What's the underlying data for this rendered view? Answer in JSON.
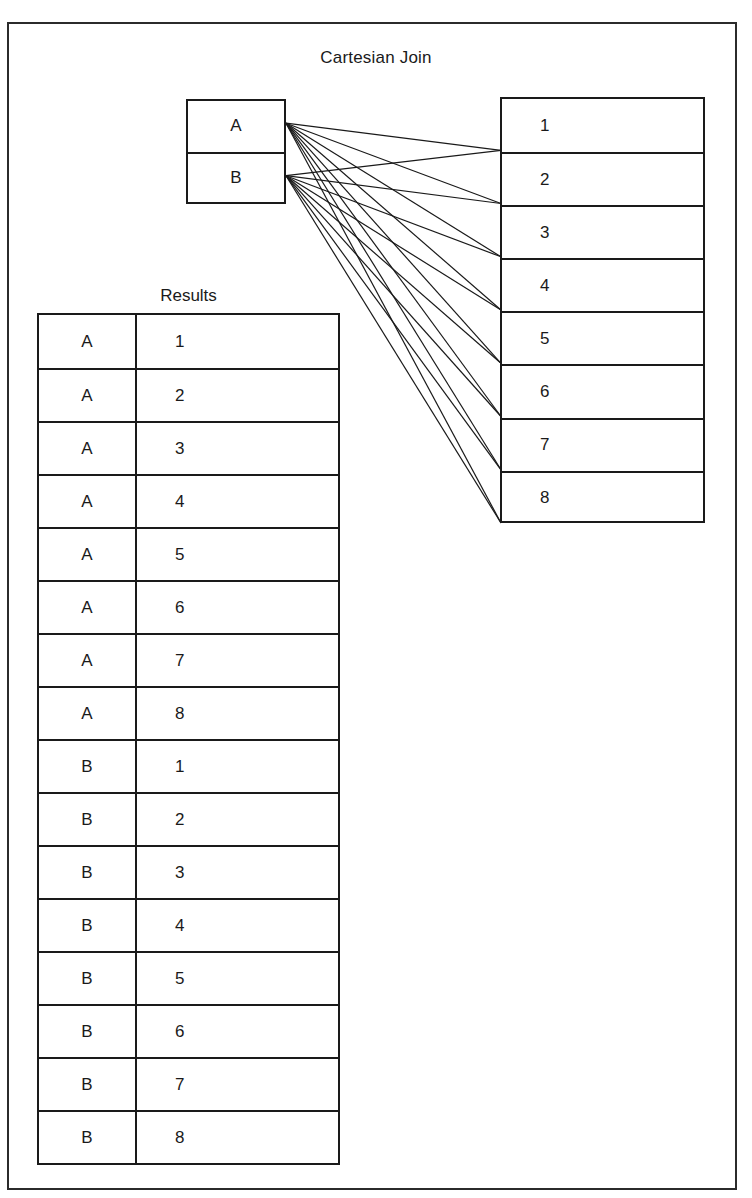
{
  "figure": {
    "title": "Cartesian Join",
    "background_color": "#ffffff",
    "line_color": "#1a1a1a",
    "frame_color": "#2b2b2b"
  },
  "left_table": {
    "name": "letters-table",
    "rows": [
      "A",
      "B"
    ]
  },
  "right_table": {
    "name": "numbers-table",
    "rows": [
      "1",
      "2",
      "3",
      "4",
      "5",
      "6",
      "7",
      "8"
    ]
  },
  "results": {
    "label": "Results",
    "columns": [
      "letter",
      "number"
    ],
    "rows": [
      {
        "letter": "A",
        "number": "1"
      },
      {
        "letter": "A",
        "number": "2"
      },
      {
        "letter": "A",
        "number": "3"
      },
      {
        "letter": "A",
        "number": "4"
      },
      {
        "letter": "A",
        "number": "5"
      },
      {
        "letter": "A",
        "number": "6"
      },
      {
        "letter": "A",
        "number": "7"
      },
      {
        "letter": "A",
        "number": "8"
      },
      {
        "letter": "B",
        "number": "1"
      },
      {
        "letter": "B",
        "number": "2"
      },
      {
        "letter": "B",
        "number": "3"
      },
      {
        "letter": "B",
        "number": "4"
      },
      {
        "letter": "B",
        "number": "5"
      },
      {
        "letter": "B",
        "number": "6"
      },
      {
        "letter": "B",
        "number": "7"
      },
      {
        "letter": "B",
        "number": "8"
      }
    ]
  },
  "connections": {
    "description": "every left row connects to every right row",
    "sources": [
      "A",
      "B"
    ],
    "targets": [
      "1",
      "2",
      "3",
      "4",
      "5",
      "6",
      "7",
      "8"
    ]
  }
}
